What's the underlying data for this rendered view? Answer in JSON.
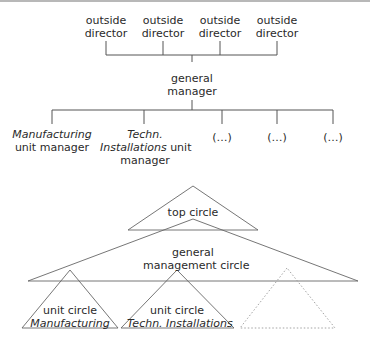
{
  "org_chart": {
    "directors": [
      {
        "line1": "outside",
        "line2": "director"
      },
      {
        "line1": "outside",
        "line2": "director"
      },
      {
        "line1": "outside",
        "line2": "director"
      },
      {
        "line1": "outside",
        "line2": "director"
      }
    ],
    "general_manager": {
      "line1": "general",
      "line2": "manager"
    },
    "units": [
      {
        "italic": "Manufacturing",
        "rest": "unit manager"
      },
      {
        "italic_line1": "Techn.",
        "italic_line2": "Installations",
        "rest_line2": " unit",
        "rest_line3": "manager"
      },
      {
        "label": "(…)"
      },
      {
        "label": "(…)"
      },
      {
        "label": "(…)"
      }
    ]
  },
  "circle_diagram": {
    "top_circle": "top circle",
    "general_management_circle": {
      "line1": "general",
      "line2": "management circle"
    },
    "unit_circles": [
      {
        "line1": "unit circle",
        "line2": "Manufacturing"
      },
      {
        "line1": "unit circle",
        "line2": "Techn. Installations"
      }
    ],
    "placeholder_circle": "dotted-triangle"
  }
}
